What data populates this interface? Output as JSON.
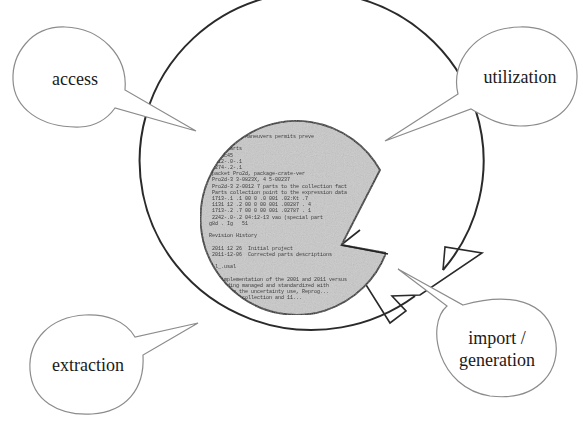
{
  "diagram": {
    "type": "lifecycle-cycle",
    "center": {
      "description": "scanned document page (circular, gray) with wedge cut-out",
      "doc_text_lines": [
        "... catalogue Maneuvers permits preve",
        "...",
        "   view/parts",
        "   r.unc45",
        "   2012-.0-.1",
        "   2274-.2-.1",
        "   packet Pro2d, package-crate-ver",
        "   Pro2d-3 3-0823X, 4 5-00237",
        "   Pro2d-3 2-0012 7 parts to the collection fact",
        "   Parts collection point to the expression data",
        "   1713-.1 .1 00 0 .0 001 .02:Kt .7",
        "   1131 12 .2 00 0 00 001 .00287 . 4",
        "   1713-.2 .7 00 0 00 001 .02787 . 1",
        "   2242-.0-.2 04:12-13 vao (special part",
        "  g8d . Ig   51",
        "",
        "  Revision History",
        "",
        "   2011 12 26  Initial project",
        "   2011-12-06  Corrected parts descriptions",
        "",
        "  ..l_.usal",
        "",
        "   an implementation of the 2001 and 2011 versus",
        "   providing managed and standardized with",
        "   ... from the uncertainty use, Reprog...",
        "   ... parts collection and 11..."
      ]
    },
    "bubbles": [
      {
        "id": "access",
        "label": "access",
        "position": "top-left"
      },
      {
        "id": "utilization",
        "label": "utilization",
        "position": "top-right"
      },
      {
        "id": "extraction",
        "label": "extraction",
        "position": "bottom-left"
      },
      {
        "id": "import-generation",
        "label_line1": "import /",
        "label_line2": "generation",
        "position": "bottom-right"
      }
    ],
    "colors": {
      "ring_stroke": "#2a2a2a",
      "bubble_stroke": "#8c8c8c",
      "doc_fill": "#c9c9c9",
      "background": "#ffffff"
    }
  }
}
